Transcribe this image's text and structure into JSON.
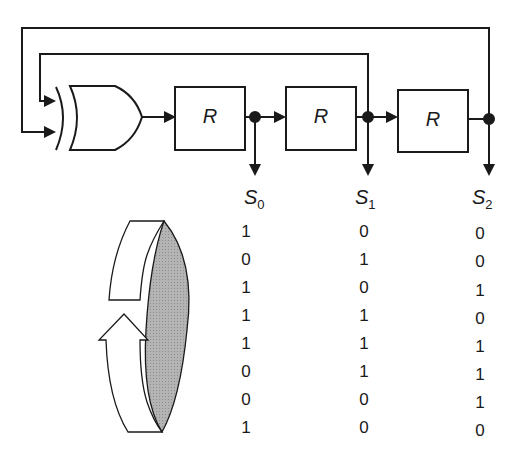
{
  "diagram": {
    "gate": {
      "type": "XOR",
      "inputs": [
        "S1",
        "S2"
      ]
    },
    "registers": [
      {
        "id": "reg-0",
        "label": "R",
        "output": "S0"
      },
      {
        "id": "reg-1",
        "label": "R",
        "output": "S1"
      },
      {
        "id": "reg-2",
        "label": "R",
        "output": "S2"
      }
    ],
    "outputs": [
      {
        "name": "S",
        "sub": "0"
      },
      {
        "name": "S",
        "sub": "1"
      },
      {
        "name": "S",
        "sub": "2"
      }
    ],
    "colors": {
      "line": "#1a1a1a",
      "ring_shade": "#b0b0b0",
      "background": "#ffffff"
    }
  },
  "table": {
    "columns": [
      "S0",
      "S1",
      "S2"
    ],
    "rows": [
      [
        "1",
        "0",
        "0"
      ],
      [
        "0",
        "1",
        "0"
      ],
      [
        "1",
        "0",
        "1"
      ],
      [
        "1",
        "1",
        "0"
      ],
      [
        "1",
        "1",
        "1"
      ],
      [
        "0",
        "1",
        "1"
      ],
      [
        "0",
        "0",
        "1"
      ],
      [
        "1",
        "0",
        "0"
      ]
    ]
  },
  "cycle_icon": "circular-arrow-ring-icon"
}
